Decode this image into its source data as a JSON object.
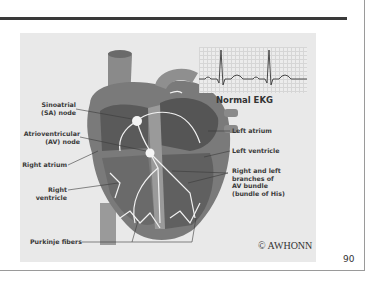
{
  "slide": {
    "page_number": "90",
    "copyright": "© AWHONN"
  },
  "figure": {
    "ekg_inset": {
      "label": "Normal EKG"
    },
    "labels_left": [
      {
        "line1": "Sinoatrial",
        "line2": "(SA) node"
      },
      {
        "line1": "Atrioventricular",
        "line2": "(AV) node"
      },
      {
        "line1": "Right atrium",
        "line2": ""
      },
      {
        "line1": "Right ventricle",
        "line2": ""
      },
      {
        "line1": "Purkinje fibers",
        "line2": ""
      }
    ],
    "labels_right": [
      {
        "text": "Left atrium"
      },
      {
        "text": "Left ventricle"
      },
      {
        "line1": "Right and left",
        "line2": "branches of",
        "line3": "AV bundle",
        "line4": "(bundle of His)"
      }
    ]
  },
  "colors": {
    "rule": "#3a3a3a",
    "panel_bg": "#e9e9e9",
    "text": "#3a3a3a"
  }
}
